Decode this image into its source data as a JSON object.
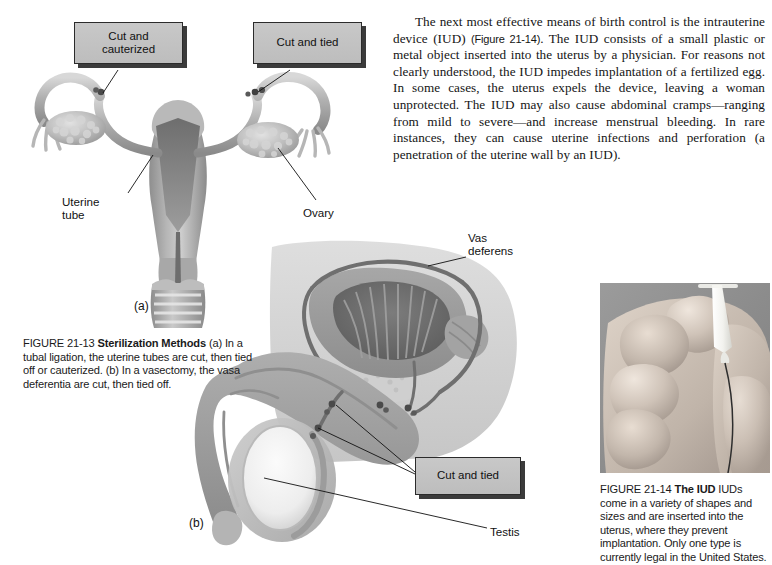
{
  "page": {
    "width": 772,
    "height": 565,
    "background": "#ffffff"
  },
  "body_text": {
    "paragraph_part1": "The next most effective means of birth control is the intrauterine device (IUD) ",
    "figure_reference": "(Figure 21-14)",
    "paragraph_part2": ". The IUD consists of a small plastic or metal object inserted into the uterus by a physician. For reasons not clearly understood, the IUD impedes implantation of a fertilized egg. In some cases, the uterus expels the device, leaving a woman unprotected. The IUD may also cause abdominal cramps—ranging from mild to severe—and increase menstrual bleeding. In rare instances, they can cause uterine infections and perforation (a penetration of the uterine wall by an IUD)."
  },
  "figure_21_13": {
    "caption_number": "FIGURE 21-13",
    "caption_title": "Sterilization Methods",
    "caption_body": "(a) In a tubal ligation, the uterine tubes are cut, then tied off or cauterized. (b) In a vasectomy, the vasa deferentia are cut, then tied off.",
    "panel_a_letter": "(a)",
    "panel_b_letter": "(b)",
    "callouts": {
      "cut_and_cauterized": "Cut and\ncauterized",
      "cut_and_tied_female": "Cut and tied",
      "cut_and_tied_male": "Cut and tied"
    },
    "labels": {
      "uterine_tube": "Uterine\ntube",
      "ovary": "Ovary",
      "vas_deferens": "Vas\ndeferens",
      "testis": "Testis"
    }
  },
  "figure_21_14": {
    "caption_number": "FIGURE 21-14",
    "caption_title": "The IUD",
    "caption_body": "IUDs come in a variety of shapes and sizes and are inserted into the uterus, where they prevent implantation. Only one type is currently legal in the United States.",
    "photo_description": "hand-holding-t-shaped-iud"
  },
  "colors": {
    "page_background": "#ffffff",
    "text": "#141414",
    "callout_fill": "#c3c3c3",
    "callout_border": "#2b2b2b",
    "callout_shadow": "#1a1a1a",
    "anatomy_mid_gray": "#9a9a9a",
    "anatomy_light_gray": "#cfcfcf",
    "anatomy_dark_gray": "#6f6f6f",
    "photo_background": "#8c8c8c"
  }
}
